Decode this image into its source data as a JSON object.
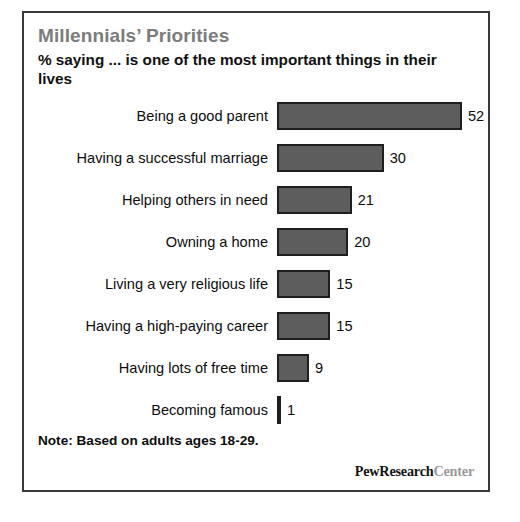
{
  "chart_data": {
    "type": "bar",
    "orientation": "horizontal",
    "title": "Millennials’ Priorities",
    "subtitle": "% saying ... is one of the most important things in their lives",
    "categories": [
      "Being a good parent",
      "Having a successful marriage",
      "Helping others in need",
      "Owning a home",
      "Living a very religious life",
      "Having a high-paying career",
      "Having lots of free time",
      "Becoming famous"
    ],
    "values": [
      52,
      30,
      21,
      20,
      15,
      15,
      9,
      1
    ],
    "value_labels": [
      "52",
      "30",
      "21",
      "20",
      "15",
      "15",
      "9",
      "1"
    ],
    "xlabel": "",
    "ylabel": "",
    "xlim": [
      0,
      52
    ],
    "grid": false,
    "legend": null,
    "data_labels": true,
    "bar_color": "#5d5d5d",
    "bar_border_color": "#1f1f1f",
    "title_color": "#7c7c7c",
    "text_color": "#0d0d0d"
  },
  "note": "Note: Based on adults ages 18-29.",
  "logo": {
    "primary": "PewResearch",
    "secondary": "Center"
  },
  "frame": {
    "border_color": "#3a3a3a",
    "background": "#ffffff"
  }
}
